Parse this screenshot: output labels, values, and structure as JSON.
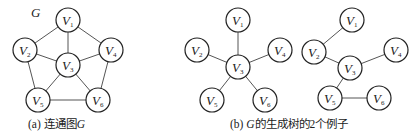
{
  "graphs": [
    {
      "id": "a",
      "label": "G",
      "caption_prefix": "(a) 连通图",
      "caption_var": "G",
      "nodes": [
        "V1",
        "V2",
        "V3",
        "V4",
        "V5",
        "V6"
      ],
      "edges": [
        [
          "V1",
          "V2"
        ],
        [
          "V1",
          "V4"
        ],
        [
          "V1",
          "V3"
        ],
        [
          "V2",
          "V3"
        ],
        [
          "V4",
          "V3"
        ],
        [
          "V2",
          "V5"
        ],
        [
          "V4",
          "V6"
        ],
        [
          "V3",
          "V5"
        ],
        [
          "V3",
          "V6"
        ],
        [
          "V5",
          "V6"
        ]
      ]
    },
    {
      "id": "b1",
      "nodes": [
        "V1",
        "V2",
        "V3",
        "V4",
        "V5",
        "V6"
      ],
      "edges": [
        [
          "V1",
          "V3"
        ],
        [
          "V2",
          "V3"
        ],
        [
          "V4",
          "V3"
        ],
        [
          "V5",
          "V3"
        ],
        [
          "V6",
          "V3"
        ]
      ]
    },
    {
      "id": "b2",
      "nodes": [
        "V1",
        "V2",
        "V3",
        "V4",
        "V5",
        "V6"
      ],
      "edges": [
        [
          "V1",
          "V2"
        ],
        [
          "V2",
          "V3"
        ],
        [
          "V3",
          "V4"
        ],
        [
          "V3",
          "V5"
        ],
        [
          "V5",
          "V6"
        ]
      ]
    }
  ],
  "caption_b": {
    "prefix": "(b) ",
    "var": "G",
    "suffix": "的生成树的2个例子"
  }
}
